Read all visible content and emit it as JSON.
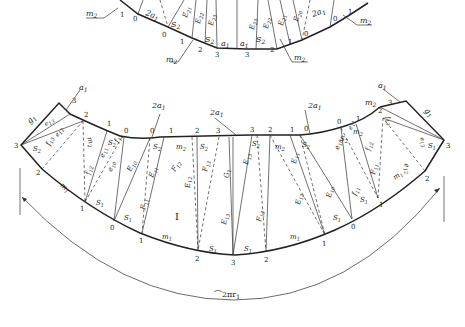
{
  "figure": {
    "type": "sheet-metal development pattern",
    "top_part": {
      "labels": {
        "m2_left_top": "m",
        "m2_left_top_sub": "2",
        "m2_left_mid": "m",
        "m2_left_mid_sub": "2",
        "m2_right_mid": "m",
        "m2_right_mid_sub": "2",
        "m2_right_top": "m",
        "m2_right_top_sub": "2",
        "a1_left": "a",
        "a1_left_sub": "1",
        "a1_right": "a",
        "a1_right_sub": "1",
        "s2_left": "S",
        "s2_left_sub": "2",
        "s2_right": "S",
        "s2_right_sub": "2",
        "s2_left_upper": "S",
        "s2_left_upper_sub": "2",
        "two_a1_left": "2a",
        "two_a1_left_sub": "1",
        "two_a1_right": "2a",
        "two_a1_right_sub": "1",
        "e23_left": "E",
        "e23_left_sub": "23",
        "e22_left": "E",
        "e22_left_sub": "22",
        "e21_left": "E",
        "e21_left_sub": "21",
        "e23_right": "E",
        "e23_right_sub": "23",
        "e22_right": "E",
        "e22_right_sub": "22",
        "e21_right": "E",
        "e21_right_sub": "21",
        "e20_right": "E",
        "e20_right_sub": "20"
      },
      "point_numbers_left": [
        "1",
        "0",
        "0",
        "1",
        "2",
        "3"
      ],
      "point_numbers_right": [
        "3",
        "2",
        "1",
        "0",
        "0",
        "1"
      ]
    },
    "bottom_part": {
      "region_label": "I",
      "arc_length_label": "⌒2πr",
      "arc_length_sub": "1",
      "top_edge_numbers": [
        "3",
        "2",
        "1",
        "0",
        "0",
        "1",
        "2",
        "3",
        "3",
        "2",
        "1",
        "0",
        "0",
        "1",
        "2",
        "3"
      ],
      "bottom_edge_numbers": [
        "3",
        "2",
        "1",
        "0",
        "1",
        "2",
        "3",
        "2",
        "1",
        "0",
        "1",
        "2",
        "3"
      ],
      "labels": {
        "a1_left": "a",
        "a1_left_sub": "1",
        "a1_right": "a",
        "a1_right_sub": "1",
        "g1_left": "g",
        "g1_left_sub": "1",
        "g1_right": "g",
        "g1_right_sub": "1",
        "two_a1_a": "2a",
        "two_a1_a_sub": "1",
        "two_a1_b": "2a",
        "two_a1_b_sub": "1",
        "two_a1_c": "2a",
        "two_a1_c_sub": "1",
        "m2": "m",
        "m2_sub": "2",
        "m1": "m",
        "m1_sub": "1",
        "s1": "S",
        "s1_sub": "1",
        "s2": "S",
        "s2_sub": "2",
        "e10": "E",
        "e10_sub": "10",
        "e11": "E",
        "e11_sub": "11",
        "e12": "E",
        "e12_sub": "12",
        "e13": "E",
        "e13_sub": "13",
        "f11": "F",
        "f11_sub": "11",
        "f12": "F",
        "f12_sub": "12",
        "f13": "F",
        "f13_sub": "13",
        "g1c": "G",
        "g1c_sub": "1",
        "e10s": "e",
        "e10s_sub": "10",
        "e11s": "e",
        "e11s_sub": "11",
        "e12s": "e",
        "e12s_sub": "12",
        "e13s": "e",
        "e13s_sub": "13",
        "f11s": "f",
        "f11s_sub": "11",
        "f12s": "f",
        "f12s_sub": "12",
        "f13s": "f",
        "f13s_sub": "13"
      }
    }
  }
}
